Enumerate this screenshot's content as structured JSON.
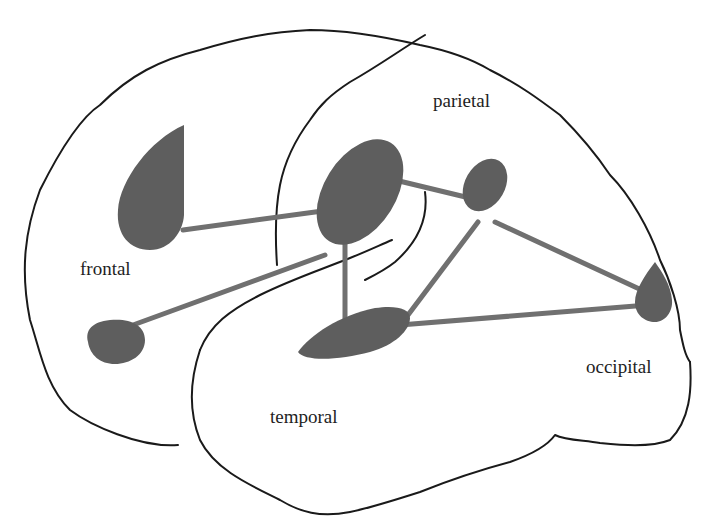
{
  "diagram": {
    "type": "brain-lobe-network",
    "labels": {
      "parietal": "parietal",
      "frontal": "frontal",
      "temporal": "temporal",
      "occipital": "occipital"
    },
    "nodes": [
      {
        "id": "frontal-upper",
        "lobe": "frontal",
        "shape": "teardrop"
      },
      {
        "id": "frontal-lower",
        "lobe": "frontal",
        "shape": "half-disc"
      },
      {
        "id": "parietal-main",
        "lobe": "parietal",
        "shape": "ellipse"
      },
      {
        "id": "parietal-small",
        "lobe": "parietal",
        "shape": "ellipse"
      },
      {
        "id": "temporal",
        "lobe": "temporal",
        "shape": "ellipse"
      },
      {
        "id": "occipital",
        "lobe": "occipital",
        "shape": "teardrop"
      }
    ],
    "edges": [
      [
        "frontal-upper",
        "parietal-main"
      ],
      [
        "frontal-lower",
        "parietal-main"
      ],
      [
        "parietal-main",
        "parietal-small"
      ],
      [
        "parietal-main",
        "temporal"
      ],
      [
        "parietal-small",
        "temporal"
      ],
      [
        "parietal-small",
        "occipital"
      ],
      [
        "temporal",
        "occipital"
      ]
    ],
    "colors": {
      "outline": "#1a1a1a",
      "node_fill": "#5e5e5e",
      "edge": "#707070",
      "background": "#ffffff"
    }
  }
}
